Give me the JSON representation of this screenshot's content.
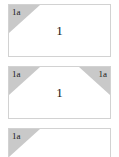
{
  "canvas": {
    "background_color": "#ffffff",
    "border_color": "#d2d2d2",
    "corner_fill_color": "#c9c9c9",
    "text_color": "#141414"
  },
  "cards": [
    {
      "id": "card-1",
      "center_value": "1",
      "corners": [
        {
          "position": "top-left",
          "label": "1a"
        }
      ]
    },
    {
      "id": "card-2",
      "center_value": "1",
      "corners": [
        {
          "position": "top-left",
          "label": "1a"
        },
        {
          "position": "top-right",
          "label": "1a"
        }
      ]
    },
    {
      "id": "card-3",
      "center_value": "",
      "corners": [
        {
          "position": "top-left",
          "label": "1a"
        }
      ]
    }
  ]
}
